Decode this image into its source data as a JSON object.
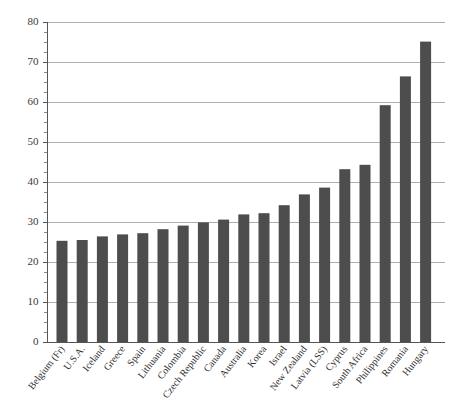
{
  "chart_data": {
    "type": "bar",
    "title": "",
    "subtitle": "",
    "xlabel": "",
    "ylabel": "",
    "ylim": [
      0,
      80
    ],
    "ytick_values": [
      0,
      10,
      20,
      30,
      40,
      50,
      60,
      70,
      80
    ],
    "ytick_labels": [
      "0",
      "10",
      "20",
      "30",
      "40",
      "50",
      "60",
      "70",
      "80"
    ],
    "yminor_step": 2.5,
    "grid": "horizontal",
    "legend": "none",
    "bar_color": "#4d4d4d",
    "categories": [
      "Belgium (Fr)",
      "U.S.A.",
      "Iceland",
      "Greece",
      "Spain",
      "Lithuania",
      "Colombia",
      "Czech Republic",
      "Canada",
      "Australia",
      "Korea",
      "Israel",
      "New Zealand",
      "Latvia (LSS)",
      "Cyprus",
      "South Africa",
      "Philippines",
      "Romania",
      "Hungary"
    ],
    "values": [
      25.3,
      25.5,
      26.4,
      26.9,
      27.2,
      28.2,
      29.1,
      29.9,
      30.6,
      31.9,
      32.2,
      34.2,
      36.9,
      38.6,
      43.2,
      44.3,
      59.2,
      66.4,
      75.1
    ]
  }
}
